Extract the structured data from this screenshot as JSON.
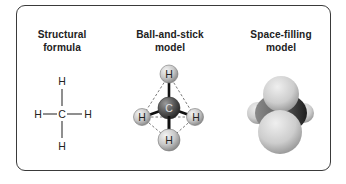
{
  "panels": [
    {
      "label_line1": "Structural",
      "label_line2": "formula",
      "formula": {
        "center_atom": "C",
        "top_atom": "H",
        "bottom_atom": "H",
        "left_atom": "H",
        "right_atom": "H"
      }
    },
    {
      "label_line1": "Ball-and-stick",
      "label_line2": "model",
      "atoms": {
        "center": "C",
        "top": "H",
        "left": "H",
        "right": "H",
        "bottom": "H"
      }
    },
    {
      "label_line1": "Space-filling",
      "label_line2": "model"
    }
  ],
  "colors": {
    "frame": "#3a3a3a",
    "text": "#222222",
    "hydrogen": "#cfcfcf",
    "carbon": "#555555"
  }
}
